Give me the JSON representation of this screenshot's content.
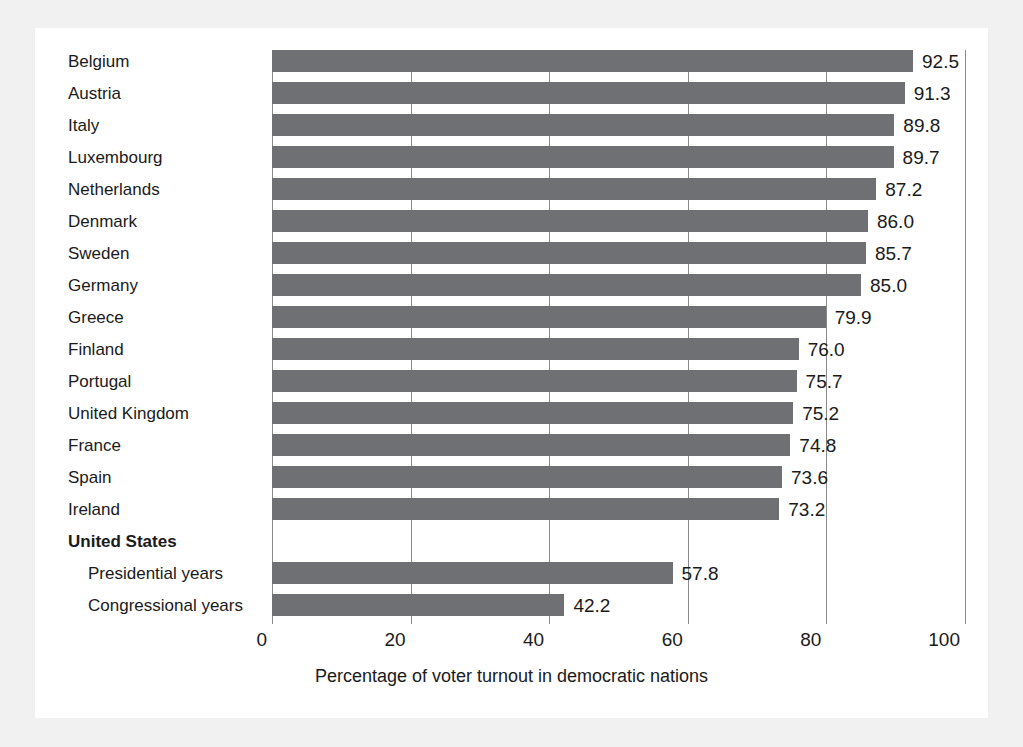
{
  "chart_data": {
    "type": "bar",
    "orientation": "horizontal",
    "title": "",
    "subtitle": "",
    "xlabel": "Percentage of voter turnout in democratic nations",
    "ylabel": "",
    "xlim": [
      0,
      100
    ],
    "xticks": [
      0,
      20,
      40,
      60,
      80,
      100
    ],
    "xtick_labels": [
      "0",
      "20",
      "40",
      "60",
      "80",
      "100"
    ],
    "grid": true,
    "legend": null,
    "bar_color": "#6f7073",
    "categories": [
      "Belgium",
      "Austria",
      "Italy",
      "Luxembourg",
      "Netherlands",
      "Denmark",
      "Sweden",
      "Germany",
      "Greece",
      "Finland",
      "Portugal",
      "United Kingdom",
      "France",
      "Spain",
      "Ireland",
      "United States",
      "Presidential years",
      "Congressional years"
    ],
    "values": [
      92.5,
      91.3,
      89.8,
      89.7,
      87.2,
      86.0,
      85.7,
      85.0,
      79.9,
      76.0,
      75.7,
      75.2,
      74.8,
      73.6,
      73.2,
      null,
      57.8,
      42.2
    ],
    "data_labels": [
      "92.5",
      "91.3",
      "89.8",
      "89.7",
      "87.2",
      "86.0",
      "85.7",
      "85.0",
      "79.9",
      "76.0",
      "75.7",
      "75.2",
      "74.8",
      "73.6",
      "73.2",
      "",
      "57.8",
      "42.2"
    ],
    "rows": [
      {
        "label": "Belgium",
        "value": 92.5,
        "data_label": "92.5",
        "style": "normal",
        "has_bar": true
      },
      {
        "label": "Austria",
        "value": 91.3,
        "data_label": "91.3",
        "style": "normal",
        "has_bar": true
      },
      {
        "label": "Italy",
        "value": 89.8,
        "data_label": "89.8",
        "style": "normal",
        "has_bar": true
      },
      {
        "label": "Luxembourg",
        "value": 89.7,
        "data_label": "89.7",
        "style": "normal",
        "has_bar": true
      },
      {
        "label": "Netherlands",
        "value": 87.2,
        "data_label": "87.2",
        "style": "normal",
        "has_bar": true
      },
      {
        "label": "Denmark",
        "value": 86.0,
        "data_label": "86.0",
        "style": "normal",
        "has_bar": true
      },
      {
        "label": "Sweden",
        "value": 85.7,
        "data_label": "85.7",
        "style": "normal",
        "has_bar": true
      },
      {
        "label": "Germany",
        "value": 85.0,
        "data_label": "85.0",
        "style": "normal",
        "has_bar": true
      },
      {
        "label": "Greece",
        "value": 79.9,
        "data_label": "79.9",
        "style": "normal",
        "has_bar": true
      },
      {
        "label": "Finland",
        "value": 76.0,
        "data_label": "76.0",
        "style": "normal",
        "has_bar": true
      },
      {
        "label": "Portugal",
        "value": 75.7,
        "data_label": "75.7",
        "style": "normal",
        "has_bar": true
      },
      {
        "label": "United Kingdom",
        "value": 75.2,
        "data_label": "75.2",
        "style": "normal",
        "has_bar": true
      },
      {
        "label": "France",
        "value": 74.8,
        "data_label": "74.8",
        "style": "normal",
        "has_bar": true
      },
      {
        "label": "Spain",
        "value": 73.6,
        "data_label": "73.6",
        "style": "normal",
        "has_bar": true
      },
      {
        "label": "Ireland",
        "value": 73.2,
        "data_label": "73.2",
        "style": "normal",
        "has_bar": true
      },
      {
        "label": "United States",
        "value": null,
        "data_label": "",
        "style": "group-header",
        "has_bar": false
      },
      {
        "label": "Presidential years",
        "value": 57.8,
        "data_label": "57.8",
        "style": "indented",
        "has_bar": true
      },
      {
        "label": "Congressional years",
        "value": 42.2,
        "data_label": "42.2",
        "style": "indented",
        "has_bar": true
      }
    ]
  }
}
